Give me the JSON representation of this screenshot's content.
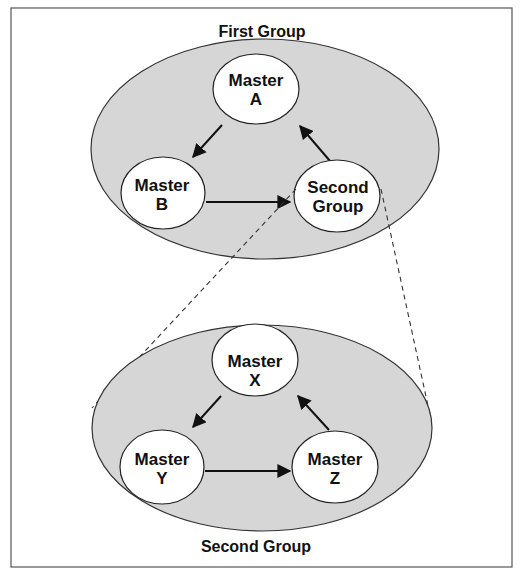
{
  "diagram": {
    "top_group": {
      "title": "First Group",
      "nodes": [
        {
          "id": "A",
          "line1": "Master",
          "line2": "A"
        },
        {
          "id": "B",
          "line1": "Master",
          "line2": "B"
        },
        {
          "id": "SG",
          "line1": "Second",
          "line2": "Group"
        }
      ],
      "edges": [
        {
          "from": "A",
          "to": "B"
        },
        {
          "from": "B",
          "to": "SG"
        },
        {
          "from": "SG",
          "to": "A"
        }
      ]
    },
    "bottom_group": {
      "title": "Second Group",
      "nodes": [
        {
          "id": "X",
          "line1": "Master",
          "line2": "X"
        },
        {
          "id": "Y",
          "line1": "Master",
          "line2": "Y"
        },
        {
          "id": "Z",
          "line1": "Master",
          "line2": "Z"
        }
      ],
      "edges": [
        {
          "from": "X",
          "to": "Y"
        },
        {
          "from": "Y",
          "to": "Z"
        },
        {
          "from": "Z",
          "to": "X"
        }
      ]
    },
    "colors": {
      "group_fill": "#d6d6d6",
      "node_fill": "#ffffff",
      "stroke": "#222222"
    }
  }
}
